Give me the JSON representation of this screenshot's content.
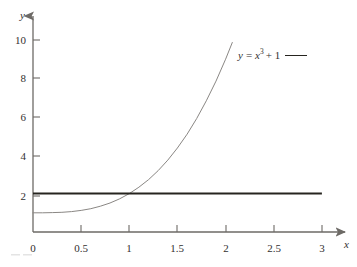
{
  "figure": {
    "background_color": "#ffffff",
    "axis_color": "#6d6a66",
    "curve_color": "#8a8784",
    "line_color": "#26241f",
    "text_color": "#33302f"
  },
  "axes": {
    "x_name": "x",
    "y_name": "y",
    "x_ticks": [
      "0",
      "0.5",
      "1",
      "1.5",
      "2",
      "2.5",
      "3"
    ],
    "y_ticks": [
      "2",
      "4",
      "6",
      "8",
      "10"
    ],
    "origin_label": "0"
  },
  "legend": {
    "prefix": "y",
    "equals": "=",
    "base": "x",
    "exponent": "3",
    "suffix": "+ 1"
  },
  "chart_data": {
    "type": "line",
    "title": "",
    "xlabel": "x",
    "ylabel": "y",
    "xlim": [
      0,
      3.1
    ],
    "ylim": [
      0,
      10.6
    ],
    "grid": false,
    "legend_position": "upper-right-inside",
    "xticks": [
      0,
      0.5,
      1,
      1.5,
      2,
      2.5,
      3
    ],
    "yticks": [
      2,
      4,
      6,
      8,
      10
    ],
    "intersection": {
      "x": 1,
      "y": 2
    },
    "series": [
      {
        "name": "y = x^3 + 1",
        "color": "#8a8784",
        "linewidth": 1,
        "x": [
          0,
          0.1,
          0.2,
          0.3,
          0.4,
          0.5,
          0.6,
          0.7,
          0.8,
          0.9,
          1.0,
          1.1,
          1.2,
          1.3,
          1.4,
          1.5,
          1.6,
          1.7,
          1.8,
          1.9,
          2.0,
          2.07
        ],
        "values": [
          1,
          1.001,
          1.008,
          1.027,
          1.064,
          1.125,
          1.216,
          1.343,
          1.512,
          1.729,
          2,
          2.331,
          2.728,
          3.197,
          3.744,
          4.375,
          5.096,
          5.913,
          6.832,
          7.859,
          9,
          9.87
        ]
      },
      {
        "name": "y = 2",
        "color": "#26241f",
        "linewidth": 2,
        "x": [
          0,
          3
        ],
        "values": [
          2,
          2
        ]
      }
    ]
  }
}
